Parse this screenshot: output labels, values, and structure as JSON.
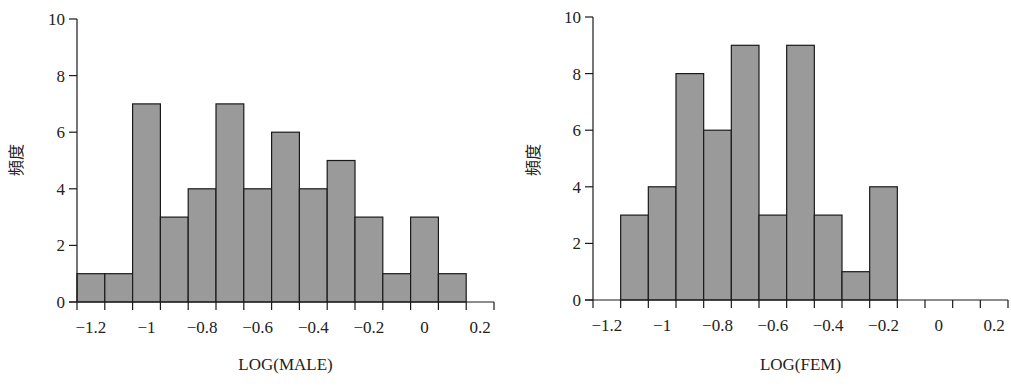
{
  "chart_data": [
    {
      "type": "bar",
      "subtype": "histogram",
      "title": "",
      "xlabel": "LOG(MALE)",
      "ylabel": "頻度",
      "bin_width": 0.1,
      "bin_centers": [
        -1.2,
        -1.1,
        -1.0,
        -0.9,
        -0.8,
        -0.7,
        -0.6,
        -0.5,
        -0.4,
        -0.3,
        -0.2,
        -0.1,
        0.0,
        0.1
      ],
      "values": [
        1,
        1,
        7,
        3,
        4,
        7,
        4,
        6,
        4,
        5,
        3,
        1,
        3,
        1
      ],
      "xlim": [
        -1.25,
        0.25
      ],
      "ylim": [
        0,
        10
      ],
      "xticks": [
        "−1.2",
        "−1",
        "−0.8",
        "−0.6",
        "−0.4",
        "−0.2",
        "0",
        "0.2"
      ],
      "xtick_values": [
        -1.2,
        -1.0,
        -0.8,
        -0.6,
        -0.4,
        -0.2,
        0.0,
        0.2
      ],
      "yticks": [
        "0",
        "2",
        "4",
        "6",
        "8",
        "10"
      ],
      "ytick_values": [
        0,
        2,
        4,
        6,
        8,
        10
      ],
      "grid": false,
      "bar_color": "#9a9a9a",
      "edge_color": "#1a1a1a"
    },
    {
      "type": "bar",
      "subtype": "histogram",
      "title": "",
      "xlabel": "LOG(FEM)",
      "ylabel": "頻度",
      "bin_width": 0.1,
      "bin_centers": [
        -1.1,
        -1.0,
        -0.9,
        -0.8,
        -0.7,
        -0.6,
        -0.5,
        -0.4,
        -0.3,
        -0.2
      ],
      "values": [
        3,
        4,
        8,
        6,
        9,
        3,
        9,
        3,
        1,
        4
      ],
      "xlim": [
        -1.25,
        0.25
      ],
      "ylim": [
        0,
        10
      ],
      "xticks": [
        "−1.2",
        "−1",
        "−0.8",
        "−0.6",
        "−0.4",
        "−0.2",
        "0",
        "0.2"
      ],
      "xtick_values": [
        -1.2,
        -1.0,
        -0.8,
        -0.6,
        -0.4,
        -0.2,
        0.0,
        0.2
      ],
      "yticks": [
        "0",
        "2",
        "4",
        "6",
        "8",
        "10"
      ],
      "ytick_values": [
        0,
        2,
        4,
        6,
        8,
        10
      ],
      "grid": false,
      "bar_color": "#9a9a9a",
      "edge_color": "#1a1a1a"
    }
  ],
  "charts": {
    "left": {
      "xlabel": "LOG(MALE)",
      "ylabel": "頻度"
    },
    "right": {
      "xlabel": "LOG(FEM)",
      "ylabel": "頻度"
    }
  }
}
